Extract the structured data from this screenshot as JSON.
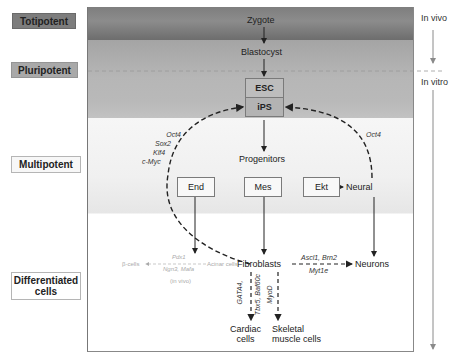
{
  "stages": [
    {
      "id": "totipotent",
      "label": "Totipotent"
    },
    {
      "id": "pluripotent",
      "label": "Pluripotent"
    },
    {
      "id": "multipotent",
      "label": "Multipotent"
    },
    {
      "id": "differentiated",
      "label": "Differentiated cells",
      "line1": "Differentiated",
      "line2": "cells"
    }
  ],
  "side_labels": {
    "in_vivo": "In vivo",
    "in_vitro": "In vitro"
  },
  "nodes": {
    "zygote": "Zygote",
    "blastocyst": "Blastocyst",
    "esc": "ESC",
    "ips": "iPS",
    "progenitors": "Progenitors",
    "end": "End",
    "mes": "Mes",
    "ekt": "Ekt",
    "neural": "Neural",
    "fibroblasts": "Fibroblasts",
    "neurons": "Neurons",
    "cardiac_line1": "Cardiac",
    "cardiac_line2": "cells",
    "skeletal_line1": "Skeletal",
    "skeletal_line2": "muscle cells",
    "beta_cells": "β-cells",
    "acinar_cells": "Acinar cells"
  },
  "factors": {
    "ips_reprogramming": [
      "Oct4",
      "Sox2",
      "Klf4",
      "c-Myc"
    ],
    "neural_to_ips": "Oct4",
    "neurons_line1": "Ascl1, Brn2",
    "neurons_line2": "Myt1e",
    "cardiac_line1": "GATA4,",
    "cardiac_line2": "Tbx5, Baf60c",
    "skeletal": "MyoD",
    "beta_line1": "Pdx1",
    "beta_line2": "Ngn3, Mafa",
    "beta_note": "(in vivo)"
  },
  "colors": {
    "totipotent_band": "#7e7e7e",
    "pluripotent_band": "#b4b4b4",
    "multipotent_band": "#f2f2f2",
    "differentiated_band": "#ffffff",
    "arrow": "#222222",
    "side_arrow": "#8a8a8a",
    "faded_text": "#aaaaaa"
  }
}
